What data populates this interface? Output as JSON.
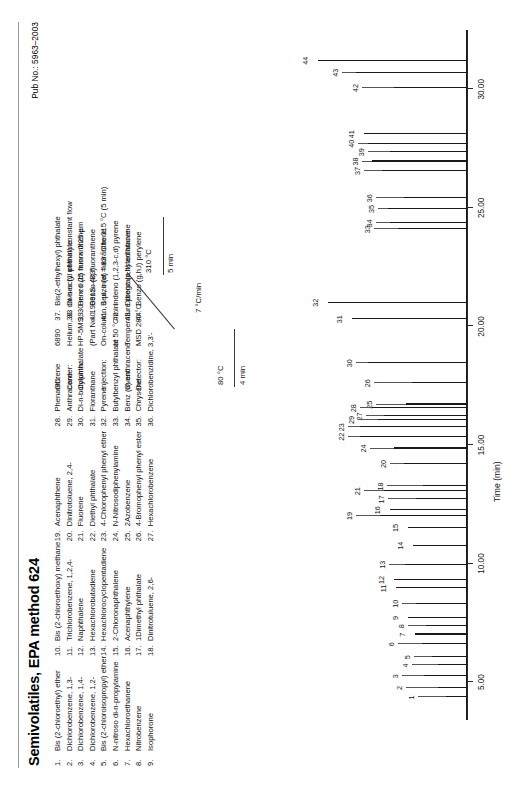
{
  "document": {
    "title": "Semivolatiles, EPA method 624",
    "pub_no": "Pub No.: 5963–2003"
  },
  "compounds": [
    {
      "n": "1.",
      "name": "Bis (2-chloroethyl) ether"
    },
    {
      "n": "2.",
      "name": "Dichlorobenzene, 1,3-"
    },
    {
      "n": "3.",
      "name": "Dichlorobenzene, 1,4-"
    },
    {
      "n": "4.",
      "name": "Dichlorobenzene, 1,2-"
    },
    {
      "n": "5.",
      "name": "Bis (2-chloroisopropyl) ether"
    },
    {
      "n": "6.",
      "name": "N-nitroso di-n-propylamine"
    },
    {
      "n": "7.",
      "name": "Hexachloroethanene"
    },
    {
      "n": "8.",
      "name": "Nitrobenzene"
    },
    {
      "n": "9.",
      "name": "Isophorone"
    },
    {
      "n": "10.",
      "name": "Bis (2-chloroethoxy) methane"
    },
    {
      "n": "11.",
      "name": "Trichlorobenzene, 1,2,4-"
    },
    {
      "n": "12.",
      "name": "Naphthalene"
    },
    {
      "n": "13.",
      "name": "Hexachlorobutadiene"
    },
    {
      "n": "14.",
      "name": "Hexachlorocyclopentadiene"
    },
    {
      "n": "15.",
      "name": "2-Chloronaphthalene"
    },
    {
      "n": "16.",
      "name": "Acenaphthylene"
    },
    {
      "n": "17.",
      "name": "1Dimethyl phthalate"
    },
    {
      "n": "18.",
      "name": "Dinitrotuluene, 2,6-"
    },
    {
      "n": "19.",
      "name": "Acenaphthene"
    },
    {
      "n": "20.",
      "name": "Dinitrotoluene, 2,4-"
    },
    {
      "n": "21.",
      "name": "Fluorene"
    },
    {
      "n": "22.",
      "name": "Diethyl phthalate"
    },
    {
      "n": "23.",
      "name": "4-Chlorophenyl phenyl ether"
    },
    {
      "n": "24.",
      "name": "N-Nitrosodiphenylamine"
    },
    {
      "n": "25.",
      "name": "2Azobenzene"
    },
    {
      "n": "26.",
      "name": "4-Bromophenyl phenyl ester"
    },
    {
      "n": "27.",
      "name": "Hexachlorobenzene"
    },
    {
      "n": "28.",
      "name": "Phenanthrene"
    },
    {
      "n": "29.",
      "name": "Anthracene"
    },
    {
      "n": "30.",
      "name": "Di-n-butylphthalate"
    },
    {
      "n": "31.",
      "name": "Floranthane"
    },
    {
      "n": "32.",
      "name": "Pyrene"
    },
    {
      "n": "33.",
      "name": "Butylbenzyl phthalate"
    },
    {
      "n": "34.",
      "name": "Benz (a) anthracene"
    },
    {
      "n": "35.",
      "name": "Chrysene"
    },
    {
      "n": "36.",
      "name": "Dichlorobenzidine, 3,3'-"
    },
    {
      "n": "37.",
      "name": "Bis(2-ethylhexyl) phthalate"
    },
    {
      "n": "38.",
      "name": "Di-n-octyl phthalate"
    },
    {
      "n": "39.",
      "name": "Benzo (b) fluoranthene"
    },
    {
      "n": "40.",
      "name": "Benzo (k) fluoranthene"
    },
    {
      "n": "41.",
      "name": "Benzo (a) fluoranthene"
    },
    {
      "n": "42.",
      "name": "Indeno (1,2,3-c,d) pyrene"
    },
    {
      "n": "43.",
      "name": "Dibenz (a,h) anthracene"
    },
    {
      "n": "44.",
      "name": "Benzo (g,h,i) perylene"
    }
  ],
  "conditions": [
    {
      "label": "GC:",
      "value": "6890",
      "value2": ""
    },
    {
      "label": "Carrier:",
      "value": "Helium, 33 cm/sec (1 ml/min) constant flow",
      "value2": ""
    },
    {
      "label": "Column:",
      "value": "HP-5MS, 30 m × 0.25 mm × 0.25 µm",
      "value2": "(Part No. 19091S–433)"
    },
    {
      "label": "Injection:",
      "value": "On-column, 1 µl, inlet = 83 °C to 315 °C (5 min)",
      "value2": "at 50 °C/min"
    },
    {
      "label": "Oven:",
      "value": "Temperature program listed above",
      "value2": ""
    },
    {
      "label": "Detector:",
      "value": "MSD 280 °C",
      "value2": ""
    }
  ],
  "temperature_program": {
    "initial_temp": "80 °C",
    "initial_hold": "4 min",
    "ramp_rate": "7 °C/min",
    "final_temp": "310 °C",
    "final_hold": "5 min"
  },
  "chart_data": {
    "type": "line",
    "title": "",
    "xlabel": "Time (min)",
    "ylabel": "",
    "xlim": [
      3.4,
      32.5
    ],
    "xticks": [
      "5.00",
      "10.00",
      "15.00",
      "20.00",
      "25.00",
      "30.00"
    ],
    "xtickvals": [
      5.0,
      10.0,
      15.0,
      20.0,
      25.0,
      30.0
    ],
    "grid": false,
    "legend": "none",
    "peaks": [
      {
        "label": "1",
        "x": 4.35,
        "h": 22
      },
      {
        "label": "2",
        "x": 4.75,
        "h": 30
      },
      {
        "label": "3",
        "x": 5.25,
        "h": 44
      },
      {
        "label": "4",
        "x": 5.7,
        "h": 30
      },
      {
        "label": "5",
        "x": 6.05,
        "h": 36
      },
      {
        "label": "6",
        "x": 6.6,
        "h": 46
      },
      {
        "label": "7",
        "x": 7.0,
        "h": 53
      },
      {
        "label": "8",
        "x": 7.35,
        "h": 42
      },
      {
        "label": "9",
        "x": 7.7,
        "h": 60
      },
      {
        "label": "10",
        "x": 8.3,
        "h": 52
      },
      {
        "label": "11",
        "x": 8.95,
        "h": 72
      },
      {
        "label": "12",
        "x": 9.3,
        "h": 74
      },
      {
        "label": "13",
        "x": 9.95,
        "h": 63
      },
      {
        "label": "14",
        "x": 10.75,
        "h": 55
      },
      {
        "label": "15",
        "x": 11.5,
        "h": 60
      },
      {
        "label": "16",
        "x": 12.25,
        "h": 78
      },
      {
        "label": "17",
        "x": 12.7,
        "h": 52
      },
      {
        "label": "18",
        "x": 13.25,
        "h": 45
      },
      {
        "label": "19",
        "x": 12.0,
        "h": 88
      },
      {
        "label": "20",
        "x": 14.2,
        "h": 64
      },
      {
        "label": "21",
        "x": 13.05,
        "h": 84
      },
      {
        "label": "22",
        "x": 15.35,
        "h": 108
      },
      {
        "label": "23",
        "x": 15.75,
        "h": 108
      },
      {
        "label": "24",
        "x": 14.85,
        "h": 74
      },
      {
        "label": "25",
        "x": 16.7,
        "h": 62
      },
      {
        "label": "26",
        "x": 17.6,
        "h": 56
      },
      {
        "label": "27",
        "x": 16.2,
        "h": 84
      },
      {
        "label": "28",
        "x": 16.55,
        "h": 96
      },
      {
        "label": "29",
        "x": 16.05,
        "h": 90
      },
      {
        "label": "30",
        "x": 18.45,
        "h": 100
      },
      {
        "label": "31",
        "x": 20.3,
        "h": 116
      },
      {
        "label": "32",
        "x": 21.0,
        "h": 140
      },
      {
        "label": "33",
        "x": 24.1,
        "h": 70
      },
      {
        "label": "34",
        "x": 24.35,
        "h": 78
      },
      {
        "label": "35",
        "x": 24.95,
        "h": 80
      },
      {
        "label": "36",
        "x": 25.4,
        "h": 64
      },
      {
        "label": "37",
        "x": 26.55,
        "h": 86
      },
      {
        "label": "38",
        "x": 26.95,
        "h": 96
      },
      {
        "label": "39",
        "x": 27.35,
        "h": 78
      },
      {
        "label": "40",
        "x": 27.7,
        "h": 100
      },
      {
        "label": "41",
        "x": 28.1,
        "h": 104
      },
      {
        "label": "42",
        "x": 30.05,
        "h": 74
      },
      {
        "label": "43",
        "x": 30.7,
        "h": 112
      },
      {
        "label": "44",
        "x": 31.2,
        "h": 150
      }
    ]
  }
}
